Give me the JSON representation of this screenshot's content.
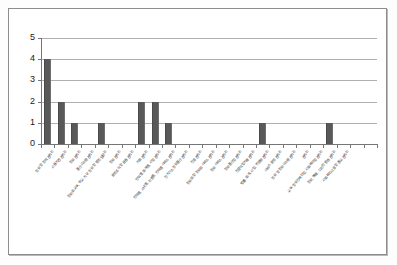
{
  "chart_data": {
    "type": "bar",
    "title": "",
    "xlabel": "",
    "ylabel": "",
    "ylim": [
      0,
      5
    ],
    "ytick_labels": [
      "0",
      "1",
      "2",
      "3",
      "4",
      "5"
    ],
    "grid": true,
    "legend": false,
    "bar_color": "#595959",
    "gridline_color": "#b0b0b0",
    "axis_color": "#767676",
    "categories": [
      "정보 및 정책 관리자",
      "사용기관 관리자",
      "정보 관리자",
      "통신시스템 관리자",
      "정보화 교육, 학교 기구, 정보 및 행정 담당자",
      "정보 관리자",
      "운영조직 및 운용 관리자",
      "기획 관리자",
      "인력별, 회계별, 사업 관리자",
      "인력별, 사내별, 자원별, 인력별 서비스 관리자",
      "전기가스 정보통신 관리자",
      "건설 관리자",
      "정보화 및 정보화 서비스 관리자",
      "정보 서비스 관리자",
      "정보통신업 관리자",
      "전문직업기술 관리자",
      "법률, 회계, 사업, 컨설팅 관리자",
      "서비스 운영 관리자",
      "정보 및 정보시스템 관리자",
      "관리자",
      "교육 및 보건복지업, 사회복지업 관리자",
      "정보, 예술, 디자인 방송 관리자",
      "사회복지시설 및 종교 관리자"
    ],
    "values": [
      4,
      2,
      1,
      0,
      1,
      0,
      0,
      2,
      2,
      1,
      0,
      0,
      0,
      0,
      0,
      0,
      1,
      0,
      0,
      0,
      0,
      1,
      0
    ],
    "xtick_count": 25
  }
}
